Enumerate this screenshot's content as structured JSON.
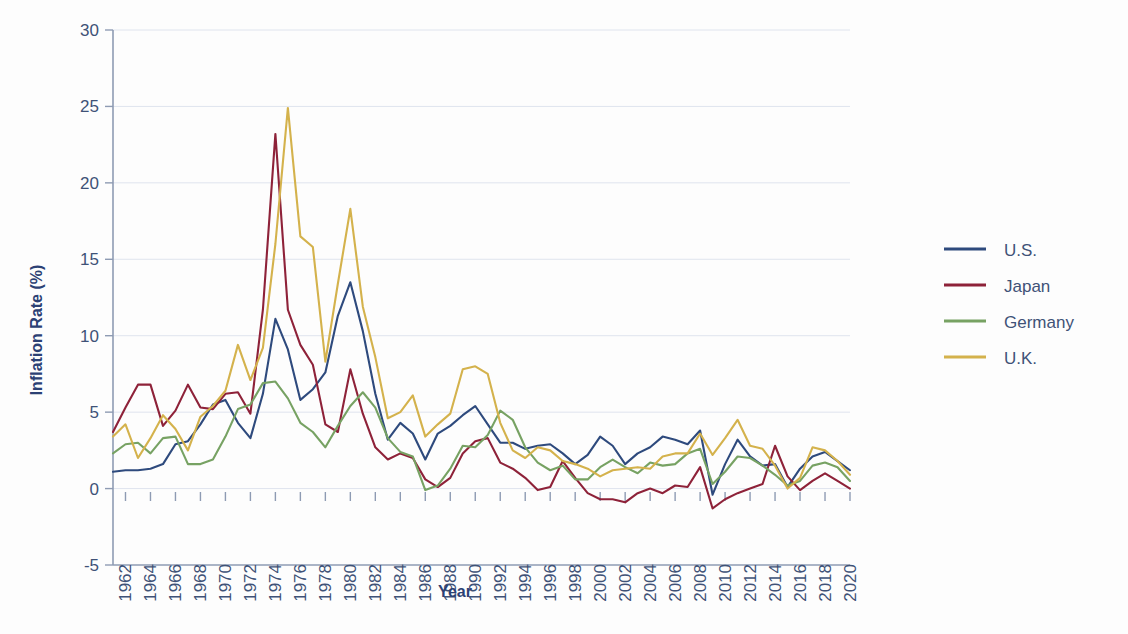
{
  "chart_data": {
    "type": "line",
    "title": "",
    "xlabel": "Year",
    "ylabel": "Inflation Rate (%)",
    "xlim": [
      1961,
      2020
    ],
    "ylim": [
      -5,
      30
    ],
    "yticks": [
      -5,
      0,
      5,
      10,
      15,
      20,
      25,
      30
    ],
    "xticks": [
      1962,
      1964,
      1966,
      1968,
      1970,
      1972,
      1974,
      1976,
      1978,
      1980,
      1982,
      1984,
      1986,
      1988,
      1990,
      1992,
      1994,
      1996,
      1998,
      2000,
      2002,
      2004,
      2006,
      2008,
      2010,
      2012,
      2014,
      2016,
      2018,
      2020
    ],
    "grid": true,
    "legend_position": "right",
    "x": [
      1961,
      1962,
      1963,
      1964,
      1965,
      1966,
      1967,
      1968,
      1969,
      1970,
      1971,
      1972,
      1973,
      1974,
      1975,
      1976,
      1977,
      1978,
      1979,
      1980,
      1981,
      1982,
      1983,
      1984,
      1985,
      1986,
      1987,
      1988,
      1989,
      1990,
      1991,
      1992,
      1993,
      1994,
      1995,
      1996,
      1997,
      1998,
      1999,
      2000,
      2001,
      2002,
      2003,
      2004,
      2005,
      2006,
      2007,
      2008,
      2009,
      2010,
      2011,
      2012,
      2013,
      2014,
      2015,
      2016,
      2017,
      2018,
      2019,
      2020
    ],
    "series": [
      {
        "name": "U.S.",
        "color": "#2e4a7d",
        "values": [
          1.1,
          1.2,
          1.2,
          1.3,
          1.6,
          2.9,
          3.1,
          4.2,
          5.5,
          5.8,
          4.3,
          3.3,
          6.2,
          11.1,
          9.1,
          5.8,
          6.5,
          7.6,
          11.3,
          13.5,
          10.3,
          6.2,
          3.2,
          4.3,
          3.6,
          1.9,
          3.6,
          4.1,
          4.8,
          5.4,
          4.2,
          3.0,
          3.0,
          2.6,
          2.8,
          2.9,
          2.3,
          1.6,
          2.2,
          3.4,
          2.8,
          1.6,
          2.3,
          2.7,
          3.4,
          3.2,
          2.9,
          3.8,
          -0.4,
          1.6,
          3.2,
          2.1,
          1.5,
          1.6,
          0.1,
          1.3,
          2.1,
          2.4,
          1.8,
          1.2
        ]
      },
      {
        "name": "Japan",
        "color": "#8e2239",
        "values": [
          3.7,
          5.3,
          6.8,
          6.8,
          4.1,
          5.1,
          6.8,
          5.3,
          5.2,
          6.2,
          6.3,
          4.9,
          11.7,
          23.2,
          11.7,
          9.4,
          8.1,
          4.2,
          3.7,
          7.8,
          4.9,
          2.7,
          1.9,
          2.3,
          2.0,
          0.6,
          0.1,
          0.7,
          2.3,
          3.1,
          3.3,
          1.7,
          1.3,
          0.7,
          -0.1,
          0.1,
          1.8,
          0.7,
          -0.3,
          -0.7,
          -0.7,
          -0.9,
          -0.3,
          0.0,
          -0.3,
          0.2,
          0.1,
          1.4,
          -1.3,
          -0.7,
          -0.3,
          0.0,
          0.3,
          2.8,
          0.8,
          -0.1,
          0.5,
          1.0,
          0.5,
          0.0
        ]
      },
      {
        "name": "Germany",
        "color": "#77a263",
        "values": [
          2.3,
          2.9,
          3.0,
          2.3,
          3.3,
          3.4,
          1.6,
          1.6,
          1.9,
          3.4,
          5.2,
          5.5,
          6.9,
          7.0,
          5.9,
          4.3,
          3.7,
          2.7,
          4.1,
          5.4,
          6.3,
          5.3,
          3.3,
          2.4,
          2.1,
          -0.1,
          0.2,
          1.3,
          2.8,
          2.7,
          3.5,
          5.1,
          4.5,
          2.7,
          1.7,
          1.2,
          1.5,
          0.6,
          0.6,
          1.4,
          1.9,
          1.4,
          1.0,
          1.7,
          1.5,
          1.6,
          2.3,
          2.6,
          0.3,
          1.1,
          2.1,
          2.0,
          1.5,
          0.9,
          0.2,
          0.5,
          1.5,
          1.7,
          1.4,
          0.5
        ]
      },
      {
        "name": "U.K.",
        "color": "#d4b24c",
        "values": [
          3.4,
          4.2,
          2.0,
          3.3,
          4.8,
          3.9,
          2.5,
          4.7,
          5.4,
          6.4,
          9.4,
          7.1,
          9.2,
          16.0,
          24.9,
          16.5,
          15.8,
          8.3,
          13.4,
          18.3,
          11.9,
          8.6,
          4.6,
          5.0,
          6.1,
          3.4,
          4.2,
          4.9,
          7.8,
          8.0,
          7.5,
          4.3,
          2.5,
          2.0,
          2.7,
          2.5,
          1.8,
          1.6,
          1.3,
          0.8,
          1.2,
          1.3,
          1.4,
          1.3,
          2.1,
          2.3,
          2.3,
          3.6,
          2.2,
          3.3,
          4.5,
          2.8,
          2.6,
          1.5,
          0.0,
          0.7,
          2.7,
          2.5,
          1.8,
          0.9
        ]
      }
    ]
  },
  "legend": {
    "items": [
      {
        "label": "U.S.",
        "color": "#2e4a7d"
      },
      {
        "label": "Japan",
        "color": "#8e2239"
      },
      {
        "label": "Germany",
        "color": "#77a263"
      },
      {
        "label": "U.K.",
        "color": "#d4b24c"
      }
    ]
  }
}
